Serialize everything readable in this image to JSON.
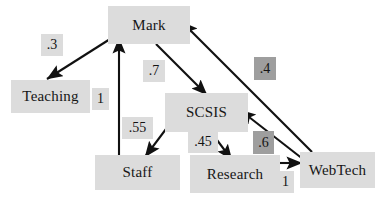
{
  "diagram": {
    "type": "directed-graph",
    "canvas": {
      "width": 383,
      "height": 203,
      "background": "#ffffff"
    },
    "colors": {
      "node_fill": "#dcdcdc",
      "weight_light_fill": "#dcdcdc",
      "weight_dark_fill": "#9e9e9e",
      "edge_stroke": "#111111",
      "text": "#161616"
    },
    "nodes": [
      {
        "id": "mark",
        "label": "Mark",
        "x": 108,
        "y": 6,
        "w": 82,
        "h": 38
      },
      {
        "id": "teaching",
        "label": "Teaching",
        "x": 11,
        "y": 80,
        "w": 79,
        "h": 33
      },
      {
        "id": "scsis",
        "label": "SCSIS",
        "x": 165,
        "y": 93,
        "w": 83,
        "h": 39
      },
      {
        "id": "staff",
        "label": "Staff",
        "x": 95,
        "y": 155,
        "w": 85,
        "h": 35
      },
      {
        "id": "research",
        "label": "Research",
        "x": 190,
        "y": 155,
        "w": 90,
        "h": 38
      },
      {
        "id": "webtech",
        "label": "WebTech",
        "x": 300,
        "y": 152,
        "w": 75,
        "h": 36
      }
    ],
    "edges": [
      {
        "id": "mark-teaching",
        "from": "mark",
        "to": "teaching",
        "weight": ".3",
        "x1": 118,
        "y1": 34,
        "x2": 47,
        "y2": 79
      },
      {
        "id": "staff-mark",
        "from": "staff",
        "to": "mark",
        "weight": "1",
        "x1": 119,
        "y1": 156,
        "x2": 119,
        "y2": 38
      },
      {
        "id": "mark-scsis",
        "from": "mark",
        "to": "scsis",
        "weight": ".7",
        "x1": 156,
        "y1": 44,
        "x2": 207,
        "y2": 95
      },
      {
        "id": "webtech-mark",
        "from": "webtech",
        "to": "mark",
        "weight": ".4",
        "x1": 312,
        "y1": 152,
        "x2": 182,
        "y2": 22
      },
      {
        "id": "scsis-staff",
        "from": "scsis",
        "to": "staff",
        "weight": ".55",
        "x1": 178,
        "y1": 113,
        "x2": 145,
        "y2": 157
      },
      {
        "id": "scsis-research",
        "from": "scsis",
        "to": "research",
        "weight": ".45",
        "x1": 211,
        "y1": 132,
        "x2": 232,
        "y2": 160
      },
      {
        "id": "webtech-scsis",
        "from": "webtech",
        "to": "scsis",
        "weight": ".6",
        "x1": 308,
        "y1": 163,
        "x2": 240,
        "y2": 110
      },
      {
        "id": "research-webtech",
        "from": "research",
        "to": "webtech",
        "weight": "1",
        "x1": 272,
        "y1": 163,
        "x2": 302,
        "y2": 163
      }
    ],
    "weights": [
      {
        "id": "w-03",
        "edge": "mark-teaching",
        "value": ".3",
        "x": 41,
        "y": 34,
        "w": 22,
        "h": 22,
        "shade": "light"
      },
      {
        "id": "w-1a",
        "edge": "staff-mark",
        "value": "1",
        "x": 92,
        "y": 88,
        "w": 17,
        "h": 22,
        "shade": "light"
      },
      {
        "id": "w-07",
        "edge": "mark-scsis",
        "value": ".7",
        "x": 143,
        "y": 60,
        "w": 22,
        "h": 22,
        "shade": "light"
      },
      {
        "id": "w-04",
        "edge": "webtech-mark",
        "value": ".4",
        "x": 254,
        "y": 57,
        "w": 22,
        "h": 23,
        "shade": "dark"
      },
      {
        "id": "w-055",
        "edge": "scsis-staff",
        "value": ".55",
        "x": 122,
        "y": 117,
        "w": 31,
        "h": 22,
        "shade": "light"
      },
      {
        "id": "w-045",
        "edge": "scsis-research",
        "value": ".45",
        "x": 188,
        "y": 131,
        "w": 30,
        "h": 22,
        "shade": "light"
      },
      {
        "id": "w-06",
        "edge": "webtech-scsis",
        "value": ".6",
        "x": 253,
        "y": 131,
        "w": 21,
        "h": 23,
        "shade": "dark"
      },
      {
        "id": "w-1b",
        "edge": "research-webtech",
        "value": "1",
        "x": 277,
        "y": 171,
        "w": 17,
        "h": 22,
        "shade": "light"
      }
    ]
  }
}
